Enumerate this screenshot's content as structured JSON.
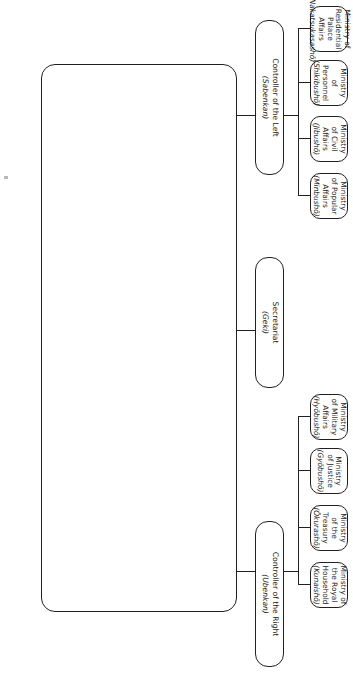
{
  "diagram": {
    "council": {
      "title_en": "The Council of State",
      "title_jp": "(Daijōkan)",
      "ranks": [
        {
          "en": "Prime Minister",
          "jp": "(Daijōdaijin)"
        },
        {
          "en": "Senior Counselor",
          "jp": "(Dainagon)"
        },
        {
          "en": "[Middle Counselor]",
          "jp": "(Chūnagon)"
        },
        {
          "en": "[Advisor]",
          "jp": "(Sangi)"
        },
        {
          "en": "[Qualified-as-Advisor]",
          "jp": "(Hisangi)"
        }
      ],
      "minister_left": "Minister of the Left",
      "minister_right": "Minister of the Right"
    },
    "controllers": [
      {
        "en": "Controller of the Left",
        "jp": "(Sabenkan)"
      },
      {
        "en": "Secretariat",
        "jp": "(Geki)"
      },
      {
        "en": "Controller of the Right",
        "jp": "(Ubenkan)"
      }
    ],
    "ministries": [
      {
        "en": "Ministry of Residential Palace Affairs",
        "jp": "(Nakatsukasashō)"
      },
      {
        "en": "Ministry of Personnel",
        "jp": "(Shikibushō)"
      },
      {
        "en": "Ministry of Civil Affairs",
        "jp": "(Jibushō)"
      },
      {
        "en": "Ministry of Popular Affairs",
        "jp": "(Minbushō)"
      },
      {
        "en": "Ministry of Military Affairs",
        "jp": "(Hyōbushō)"
      },
      {
        "en": "Ministry of Justice",
        "jp": "(Gyōbushō)"
      },
      {
        "en": "Ministry of the Treasury",
        "jp": "(Ōkurashō)"
      },
      {
        "en": "Ministry of the Royal Household",
        "jp": "(Kunaishō)"
      }
    ],
    "colors": {
      "stroke": "#231f20",
      "background": "#ffffff",
      "text": "#1a1a1a"
    }
  }
}
